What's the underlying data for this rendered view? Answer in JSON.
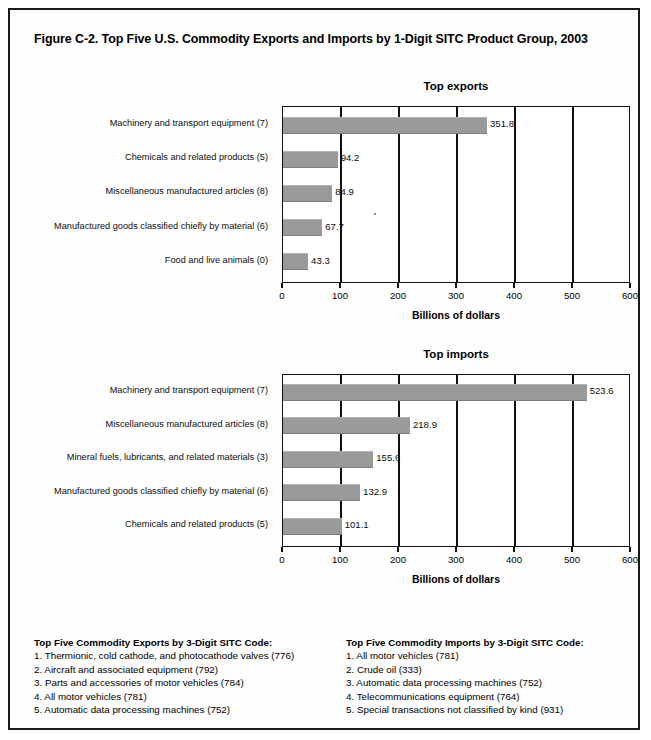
{
  "figure": {
    "title": "Figure C-2. Top Five U.S. Commodity Exports and Imports by 1-Digit SITC Product Group, 2003"
  },
  "chart_data": [
    {
      "id": "exports",
      "type": "bar",
      "orientation": "horizontal",
      "title": "Top exports",
      "xlabel": "Billions of dollars",
      "ylabel": "",
      "xlim": [
        0,
        600
      ],
      "xticks": [
        0,
        100,
        200,
        300,
        400,
        500,
        600
      ],
      "grid": "vertical",
      "legend": "none",
      "categories": [
        "Machinery and transport equipment (7)",
        "Chemicals and related products (5)",
        "Miscellaneous manufactured articles (8)",
        "Manufactured goods classified chiefly by material (6)",
        "Food and live animals (0)"
      ],
      "values": [
        351.8,
        94.2,
        84.9,
        67.7,
        43.3
      ],
      "value_labels": [
        "351.8",
        "94.2",
        "84.9",
        "67.7",
        "43.3"
      ],
      "bar_color": "#9a9a9a"
    },
    {
      "id": "imports",
      "type": "bar",
      "orientation": "horizontal",
      "title": "Top imports",
      "xlabel": "Billions of dollars",
      "ylabel": "",
      "xlim": [
        0,
        600
      ],
      "xticks": [
        0,
        100,
        200,
        300,
        400,
        500,
        600
      ],
      "grid": "vertical",
      "legend": "none",
      "categories": [
        "Machinery and transport equipment (7)",
        "Miscellaneous manufactured articles (8)",
        "Mineral fuels, lubricants, and related materials (3)",
        "Manufactured goods classified chiefly by material (6)",
        "Chemicals and related products (5)"
      ],
      "values": [
        523.6,
        218.9,
        155.6,
        132.9,
        101.1
      ],
      "value_labels": [
        "523.6",
        "218.9",
        "155.6",
        "132.9",
        "101.1"
      ],
      "bar_color": "#9a9a9a"
    }
  ],
  "notes": {
    "exports": {
      "heading": "Top Five Commodity Exports by 3-Digit SITC Code:",
      "items": [
        "1. Thermionic, cold cathode, and photocathode valves (776)",
        "2. Aircraft and associated equipment (792)",
        "3. Parts and accessories of motor vehicles (784)",
        "4. All motor vehicles (781)",
        "5. Automatic data processing machines (752)"
      ]
    },
    "imports": {
      "heading": "Top Five Commodity Imports by 3-Digit SITC Code:",
      "items": [
        "1. All motor vehicles (781)",
        "2. Crude oil (333)",
        "3. Automatic data processing machines (752)",
        "4. Telecommunications equipment (764)",
        "5. Special transactions not classified by kind (931)"
      ]
    }
  }
}
